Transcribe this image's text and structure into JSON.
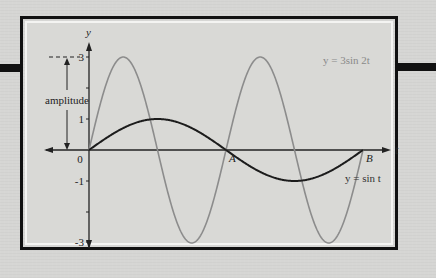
{
  "figure": {
    "y_axis_label": "y",
    "t_axis_label": "t",
    "origin_label": "0",
    "y_ticks": [
      {
        "value": 3,
        "label": "3"
      },
      {
        "value": 1,
        "label": "1"
      },
      {
        "value": -1,
        "label": "-1"
      },
      {
        "value": -3,
        "label": "-3"
      }
    ],
    "amplitude_label": "amplitude",
    "point_a_label": "A",
    "point_b_label": "B",
    "curve_1_label": "y = 3sin 2t",
    "curve_2_label": "y = sin t"
  },
  "chart_data": {
    "type": "line",
    "title": "",
    "xlabel": "t",
    "ylabel": "y",
    "ylim": [
      -3,
      3
    ],
    "xlim": [
      0,
      6.283
    ],
    "grid": false,
    "annotations": [
      "amplitude",
      "A (t = π)",
      "B (t = 2π)",
      "0"
    ],
    "series": [
      {
        "name": "y = 3sin 2t",
        "color": "#8a8a8a",
        "function": "3*sin(2t)",
        "amplitude": 3,
        "period": 3.1416
      },
      {
        "name": "y = sin t",
        "color": "#1a1a1a",
        "function": "sin(t)",
        "amplitude": 1,
        "period": 6.2832
      }
    ],
    "x": [
      0,
      0.785,
      1.571,
      2.356,
      3.142,
      3.927,
      4.712,
      5.498,
      6.283
    ],
    "series_values": {
      "y = 3sin 2t": [
        0,
        3,
        0,
        -3,
        0,
        3,
        0,
        -3,
        0
      ],
      "y = sin t": [
        0,
        0.707,
        1,
        0.707,
        0,
        -0.707,
        -1,
        -0.707,
        0
      ]
    }
  }
}
